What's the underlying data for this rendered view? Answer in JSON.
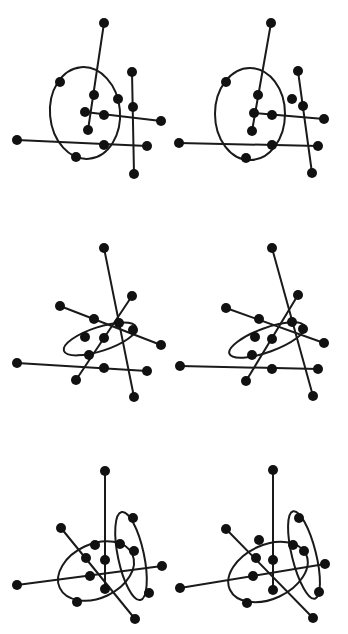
{
  "figure": {
    "width": 348,
    "height": 634,
    "colors": {
      "ink": "#111111",
      "background": "#ffffff"
    },
    "node_radius": 5
  },
  "panels": [
    {
      "name": "row1-left",
      "nodes": [
        [
          104,
          23
        ],
        [
          60,
          82
        ],
        [
          94,
          95
        ],
        [
          118,
          99
        ],
        [
          85,
          112
        ],
        [
          104,
          115
        ],
        [
          161,
          121
        ],
        [
          88,
          130
        ],
        [
          17,
          140
        ],
        [
          104,
          145
        ],
        [
          147,
          146
        ],
        [
          76,
          157
        ],
        [
          132,
          72
        ],
        [
          133,
          107
        ],
        [
          134,
          174
        ]
      ],
      "edges": [
        [
          [
            104,
            23
          ],
          [
            88,
            130
          ]
        ],
        [
          [
            85,
            112
          ],
          [
            161,
            121
          ]
        ],
        [
          [
            17,
            140
          ],
          [
            147,
            146
          ]
        ],
        [
          [
            132,
            72
          ],
          [
            134,
            174
          ]
        ]
      ],
      "ellipses": [
        {
          "cx": 85,
          "cy": 113,
          "rx": 35,
          "ry": 46,
          "rot": -5
        }
      ]
    },
    {
      "name": "row1-right",
      "nodes": [
        [
          271,
          23
        ],
        [
          226,
          82
        ],
        [
          258,
          95
        ],
        [
          292,
          99
        ],
        [
          254,
          113
        ],
        [
          272,
          115
        ],
        [
          324,
          119
        ],
        [
          252,
          131
        ],
        [
          179,
          143
        ],
        [
          272,
          145
        ],
        [
          318,
          146
        ],
        [
          246,
          158
        ],
        [
          298,
          71
        ],
        [
          303,
          106
        ],
        [
          312,
          173
        ]
      ],
      "edges": [
        [
          [
            271,
            23
          ],
          [
            252,
            131
          ]
        ],
        [
          [
            254,
            113
          ],
          [
            324,
            119
          ]
        ],
        [
          [
            179,
            143
          ],
          [
            318,
            146
          ]
        ],
        [
          [
            298,
            71
          ],
          [
            312,
            173
          ]
        ]
      ],
      "ellipses": [
        {
          "cx": 250,
          "cy": 114,
          "rx": 78,
          "ry": 46,
          "rot": 0,
          "sx": 0.47
        }
      ]
    },
    {
      "name": "row2-left",
      "nodes": [
        [
          104,
          248
        ],
        [
          60,
          306
        ],
        [
          132,
          296
        ],
        [
          94,
          319
        ],
        [
          119,
          323
        ],
        [
          133,
          330
        ],
        [
          85,
          337
        ],
        [
          104,
          338
        ],
        [
          161,
          345
        ],
        [
          89,
          355
        ],
        [
          17,
          363
        ],
        [
          104,
          368
        ],
        [
          147,
          371
        ],
        [
          76,
          380
        ],
        [
          134,
          397
        ]
      ],
      "edges": [
        [
          [
            104,
            248
          ],
          [
            134,
            397
          ]
        ],
        [
          [
            60,
            306
          ],
          [
            161,
            345
          ]
        ],
        [
          [
            132,
            296
          ],
          [
            76,
            380
          ]
        ],
        [
          [
            17,
            363
          ],
          [
            147,
            371
          ]
        ]
      ],
      "ellipses": [
        {
          "cx": 100,
          "cy": 339,
          "rx": 38,
          "ry": 12,
          "rot": -18
        }
      ]
    },
    {
      "name": "row2-right",
      "nodes": [
        [
          272,
          248
        ],
        [
          226,
          308
        ],
        [
          298,
          295
        ],
        [
          259,
          319
        ],
        [
          292,
          322
        ],
        [
          303,
          329
        ],
        [
          255,
          337
        ],
        [
          272,
          339
        ],
        [
          324,
          343
        ],
        [
          252,
          355
        ],
        [
          180,
          366
        ],
        [
          272,
          369
        ],
        [
          318,
          369
        ],
        [
          246,
          381
        ],
        [
          313,
          396
        ]
      ],
      "edges": [
        [
          [
            272,
            248
          ],
          [
            313,
            396
          ]
        ],
        [
          [
            226,
            308
          ],
          [
            324,
            343
          ]
        ],
        [
          [
            298,
            295
          ],
          [
            246,
            381
          ]
        ],
        [
          [
            180,
            366
          ],
          [
            318,
            369
          ]
        ]
      ],
      "ellipses": [
        {
          "cx": 267,
          "cy": 340,
          "rx": 40,
          "ry": 12,
          "rot": -20
        }
      ]
    },
    {
      "name": "row3-left",
      "nodes": [
        [
          105,
          471
        ],
        [
          133,
          518
        ],
        [
          61,
          528
        ],
        [
          95,
          545
        ],
        [
          120,
          544
        ],
        [
          86,
          558
        ],
        [
          105,
          560
        ],
        [
          134,
          551
        ],
        [
          162,
          566
        ],
        [
          90,
          576
        ],
        [
          17,
          585
        ],
        [
          105,
          589
        ],
        [
          149,
          593
        ],
        [
          77,
          602
        ],
        [
          135,
          619
        ]
      ],
      "edges": [
        [
          [
            105,
            471
          ],
          [
            105,
            589
          ]
        ],
        [
          [
            61,
            528
          ],
          [
            135,
            619
          ]
        ],
        [
          [
            17,
            585
          ],
          [
            162,
            566
          ]
        ]
      ],
      "ellipses": [
        {
          "cx": 96,
          "cy": 571,
          "rx": 40,
          "ry": 27,
          "rot": -25
        },
        {
          "cx": 131,
          "cy": 556,
          "rx": 13,
          "ry": 45,
          "rot": -12
        }
      ]
    },
    {
      "name": "row3-right",
      "nodes": [
        [
          273,
          470
        ],
        [
          299,
          518
        ],
        [
          226,
          529
        ],
        [
          259,
          540
        ],
        [
          293,
          545
        ],
        [
          304,
          551
        ],
        [
          256,
          558
        ],
        [
          273,
          560
        ],
        [
          325,
          564
        ],
        [
          253,
          576
        ],
        [
          180,
          588
        ],
        [
          273,
          590
        ],
        [
          319,
          592
        ],
        [
          247,
          603
        ],
        [
          313,
          618
        ]
      ],
      "edges": [
        [
          [
            273,
            470
          ],
          [
            273,
            590
          ]
        ],
        [
          [
            226,
            529
          ],
          [
            313,
            618
          ]
        ],
        [
          [
            180,
            588
          ],
          [
            325,
            564
          ]
        ]
      ],
      "ellipses": [
        {
          "cx": 268,
          "cy": 572,
          "rx": 42,
          "ry": 27,
          "rot": -25
        },
        {
          "cx": 304,
          "cy": 555,
          "rx": 12,
          "ry": 45,
          "rot": -14
        }
      ]
    }
  ]
}
